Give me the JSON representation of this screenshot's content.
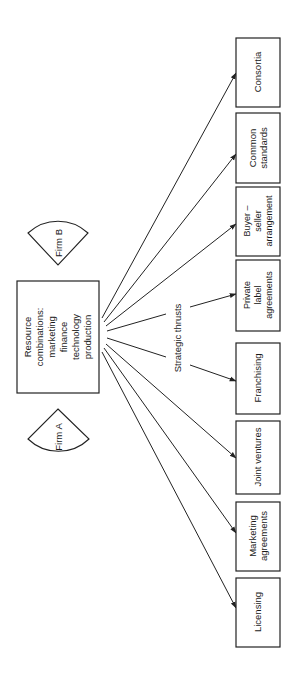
{
  "diagram": {
    "center_box": {
      "lines": [
        "Resource",
        "combinations:",
        "marketing",
        "finance",
        "technology",
        "production"
      ]
    },
    "firms": [
      {
        "id": "firm-b",
        "label": "Firm B"
      },
      {
        "id": "firm-a",
        "label": "Firm A"
      }
    ],
    "edge_label": "Strategic thrusts",
    "targets": [
      {
        "id": "consortia",
        "lines": [
          "Consortia"
        ]
      },
      {
        "id": "common-standards",
        "lines": [
          "Common",
          "standards"
        ]
      },
      {
        "id": "buyer-seller",
        "lines": [
          "Buyer –",
          "seller",
          "arrangement"
        ]
      },
      {
        "id": "private-label",
        "lines": [
          "Private",
          "label",
          "agreements"
        ]
      },
      {
        "id": "franchising",
        "lines": [
          "Franchising"
        ]
      },
      {
        "id": "joint-ventures",
        "lines": [
          "Joint ventures"
        ]
      },
      {
        "id": "marketing-agreements",
        "lines": [
          "Marketing",
          "agreements"
        ]
      },
      {
        "id": "licensing",
        "lines": [
          "Licensing"
        ]
      }
    ]
  }
}
